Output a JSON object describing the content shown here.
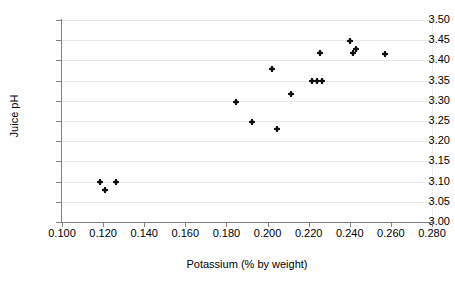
{
  "chart_data": {
    "type": "scatter",
    "title": "",
    "xlabel": "Potassium (% by weight)",
    "ylabel": "Juice pH",
    "xlim": [
      0.1,
      0.28
    ],
    "ylim": [
      3.0,
      3.5
    ],
    "xticks": [
      "0.100",
      "0.120",
      "0.140",
      "0.160",
      "0.180",
      "0.200",
      "0.220",
      "0.240",
      "0.260",
      "0.280"
    ],
    "xtick_values": [
      0.1,
      0.12,
      0.14,
      0.16,
      0.18,
      0.2,
      0.22,
      0.24,
      0.26,
      0.28
    ],
    "yticks": [
      "3.00",
      "3.05",
      "3.10",
      "3.15",
      "3.20",
      "3.25",
      "3.30",
      "3.35",
      "3.40",
      "3.45",
      "3.50"
    ],
    "ytick_values": [
      3.0,
      3.05,
      3.1,
      3.15,
      3.2,
      3.25,
      3.3,
      3.35,
      3.4,
      3.45,
      3.5
    ],
    "grid": "horizontal",
    "legend": "none",
    "marker_color": "#111111",
    "gridline_color": "#e8e8e8",
    "axis_color": "#808080",
    "points": [
      {
        "x": 0.1185,
        "y": 3.1
      },
      {
        "x": 0.121,
        "y": 3.079
      },
      {
        "x": 0.1262,
        "y": 3.099
      },
      {
        "x": 0.1848,
        "y": 3.298
      },
      {
        "x": 0.1922,
        "y": 3.248
      },
      {
        "x": 0.2022,
        "y": 3.378
      },
      {
        "x": 0.2046,
        "y": 3.229
      },
      {
        "x": 0.2112,
        "y": 3.318
      },
      {
        "x": 0.2218,
        "y": 3.348
      },
      {
        "x": 0.224,
        "y": 3.348
      },
      {
        "x": 0.2254,
        "y": 3.418
      },
      {
        "x": 0.2266,
        "y": 3.348
      },
      {
        "x": 0.2402,
        "y": 3.447
      },
      {
        "x": 0.2414,
        "y": 3.418
      },
      {
        "x": 0.2432,
        "y": 3.427
      },
      {
        "x": 0.257,
        "y": 3.417
      }
    ]
  }
}
